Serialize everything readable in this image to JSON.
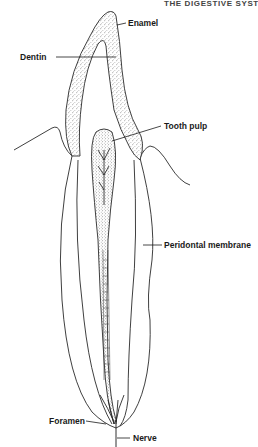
{
  "header": {
    "text": "THE DIGESTIVE SYST"
  },
  "diagram": {
    "labels": {
      "enamel": "Enamel",
      "dentin": "Dentin",
      "tooth_pulp": "Tooth pulp",
      "peridontal_membrane": "Peridontal membrane",
      "foramen": "Foramen",
      "nerve": "Nerve"
    },
    "colors": {
      "line": "#2a2a2a",
      "stipple": "#555555",
      "background": "#ffffff"
    }
  }
}
